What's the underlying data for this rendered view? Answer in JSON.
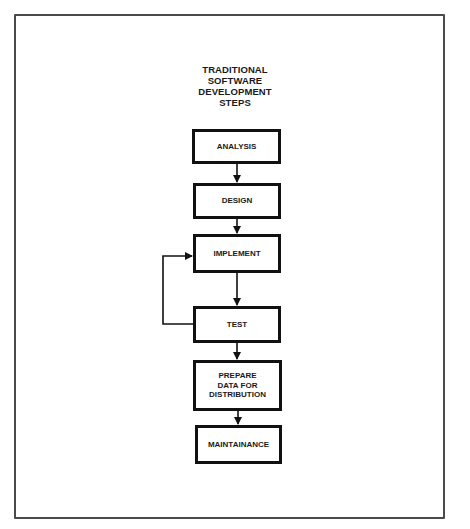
{
  "diagram": {
    "title_lines": [
      "TRADITIONAL",
      "SOFTWARE",
      "DEVELOPMENT",
      "STEPS"
    ],
    "steps": [
      {
        "id": "analysis",
        "lines": [
          "ANALYSIS"
        ]
      },
      {
        "id": "design",
        "lines": [
          "DESIGN"
        ]
      },
      {
        "id": "implement",
        "lines": [
          "IMPLEMENT"
        ]
      },
      {
        "id": "test",
        "lines": [
          "TEST"
        ]
      },
      {
        "id": "prepare-data",
        "lines": [
          "PREPARE",
          "DATA FOR",
          "DISTRIBUTION"
        ]
      },
      {
        "id": "maintainance",
        "lines": [
          "MAINTAINANCE"
        ]
      }
    ],
    "edges": [
      {
        "from": "analysis",
        "to": "design"
      },
      {
        "from": "design",
        "to": "implement"
      },
      {
        "from": "implement",
        "to": "test"
      },
      {
        "from": "test",
        "to": "prepare-data"
      },
      {
        "from": "prepare-data",
        "to": "maintainance"
      },
      {
        "from": "test",
        "to": "implement",
        "type": "feedback-loop"
      }
    ],
    "colors": {
      "stroke": "#111111",
      "frame": "#4a4a4a",
      "background": "#ffffff"
    }
  }
}
